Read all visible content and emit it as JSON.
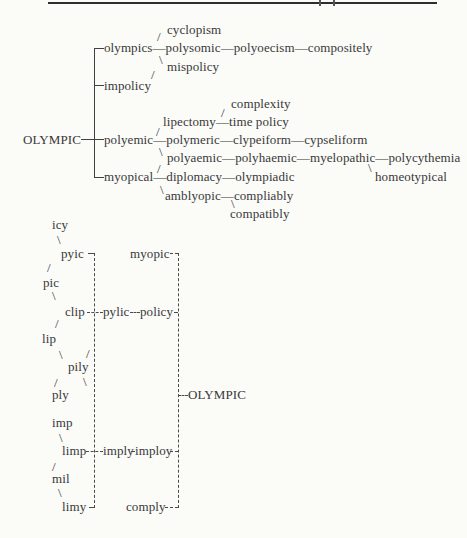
{
  "page": {
    "bg": "#fbfbf8",
    "ink": "#383838",
    "rule": {
      "x": 48,
      "y": 2,
      "w": 389,
      "h": 2
    },
    "ticks": [
      {
        "x": 319,
        "y": 0,
        "h": 6
      },
      {
        "x": 333,
        "y": 0,
        "h": 6
      }
    ]
  },
  "upper_tree": {
    "root_word": "OLYMPIC",
    "rows": [
      {
        "x": 167,
        "y": 23,
        "tokens": [
          "cyclopism"
        ]
      },
      {
        "x": 104,
        "y": 41,
        "tokens": [
          "olympics",
          "—",
          "polysomic",
          "—",
          "polyoecism",
          "—",
          "compositely"
        ]
      },
      {
        "x": 167,
        "y": 60,
        "tokens": [
          "mispolicy"
        ]
      },
      {
        "x": 104,
        "y": 79,
        "tokens": [
          "impolicy"
        ]
      },
      {
        "x": 231,
        "y": 97,
        "tokens": [
          "complexity"
        ]
      },
      {
        "x": 163,
        "y": 115,
        "tokens": [
          "lipectomy",
          "—",
          "time policy"
        ]
      },
      {
        "x": 23,
        "y": 133,
        "tokens": [
          "OLYMPIC"
        ]
      },
      {
        "x": 104,
        "y": 133,
        "tokens": [
          "polyemic",
          "—",
          "polymeric",
          "—",
          "clypeiform",
          "—",
          "cypseliform"
        ]
      },
      {
        "x": 167,
        "y": 151,
        "tokens": [
          "polyaemic",
          "—",
          "polyhaemic",
          "—",
          "myelopathic",
          "—",
          "polycythemia"
        ]
      },
      {
        "x": 104,
        "y": 170,
        "tokens": [
          "myopical",
          "—",
          "diplomacy",
          "—",
          "olympiadic"
        ]
      },
      {
        "x": 375,
        "y": 170,
        "tokens": [
          "homeotypical"
        ]
      },
      {
        "x": 165,
        "y": 189,
        "tokens": [
          "amblyopic",
          "—",
          "compliably"
        ]
      },
      {
        "x": 230,
        "y": 207,
        "tokens": [
          "compatibly"
        ]
      }
    ],
    "bracket": {
      "x": 94,
      "y1": 48,
      "y2": 177
    },
    "stubs": [
      {
        "x1": 94,
        "x2": 104,
        "y": 48
      },
      {
        "x1": 94,
        "x2": 104,
        "y": 85
      },
      {
        "x1": 81,
        "x2": 104,
        "y": 139
      },
      {
        "x1": 94,
        "x2": 104,
        "y": 177
      }
    ],
    "slashes": [
      {
        "g": "/",
        "x": 157,
        "y": 30
      },
      {
        "g": "\\",
        "x": 159,
        "y": 53
      },
      {
        "g": "/",
        "x": 151,
        "y": 68
      },
      {
        "g": "/",
        "x": 221,
        "y": 106
      },
      {
        "g": "/",
        "x": 156,
        "y": 125
      },
      {
        "g": "\\",
        "x": 159,
        "y": 145
      },
      {
        "g": "/",
        "x": 157,
        "y": 162
      },
      {
        "g": "\\",
        "x": 160,
        "y": 183
      },
      {
        "g": "\\",
        "x": 368,
        "y": 161
      },
      {
        "g": "\\",
        "x": 231,
        "y": 197
      }
    ]
  },
  "lower_chart": {
    "words": [
      {
        "t": "icy",
        "x": 52,
        "y": 218
      },
      {
        "t": "pyic",
        "x": 61,
        "y": 247
      },
      {
        "t": "myopic",
        "x": 130,
        "y": 247
      },
      {
        "t": "pic",
        "x": 43,
        "y": 276
      },
      {
        "t": "clip",
        "x": 65,
        "y": 305
      },
      {
        "t": "pylic",
        "x": 103,
        "y": 305
      },
      {
        "t": "policy",
        "x": 140,
        "y": 305
      },
      {
        "t": "lip",
        "x": 42,
        "y": 332
      },
      {
        "t": "pily",
        "x": 68,
        "y": 360
      },
      {
        "t": "ply",
        "x": 52,
        "y": 388
      },
      {
        "t": "OLYMPIC",
        "x": 188,
        "y": 388
      },
      {
        "t": "imp",
        "x": 52,
        "y": 416
      },
      {
        "t": "limp",
        "x": 62,
        "y": 444
      },
      {
        "t": "imply",
        "x": 103,
        "y": 444
      },
      {
        "t": "imploy",
        "x": 135,
        "y": 444
      },
      {
        "t": "mil",
        "x": 52,
        "y": 472
      },
      {
        "t": "limy",
        "x": 62,
        "y": 500
      },
      {
        "t": "comply",
        "x": 126,
        "y": 500
      }
    ],
    "slashes": [
      {
        "g": "\\",
        "x": 57,
        "y": 233
      },
      {
        "g": "/",
        "x": 47,
        "y": 261
      },
      {
        "g": "\\",
        "x": 52,
        "y": 289
      },
      {
        "g": "/",
        "x": 55,
        "y": 317
      },
      {
        "g": "\\",
        "x": 59,
        "y": 348
      },
      {
        "g": "/",
        "x": 86,
        "y": 347
      },
      {
        "g": "/",
        "x": 54,
        "y": 376
      },
      {
        "g": "\\",
        "x": 83,
        "y": 375
      },
      {
        "g": "\\",
        "x": 59,
        "y": 431
      },
      {
        "g": "/",
        "x": 52,
        "y": 460
      },
      {
        "g": "\\",
        "x": 58,
        "y": 486
      }
    ],
    "rails": [
      {
        "x": 94,
        "y1": 253,
        "y2": 508
      },
      {
        "x": 178,
        "y1": 253,
        "y2": 508
      }
    ],
    "dashes": [
      {
        "x1": 88,
        "x2": 94,
        "y": 253
      },
      {
        "x1": 170,
        "x2": 178,
        "y": 253
      },
      {
        "x1": 87,
        "x2": 103,
        "y": 312
      },
      {
        "x1": 130,
        "x2": 140,
        "y": 312
      },
      {
        "x1": 174,
        "x2": 178,
        "y": 312
      },
      {
        "x1": 178,
        "x2": 188,
        "y": 395
      },
      {
        "x1": 86,
        "x2": 103,
        "y": 451
      },
      {
        "x1": 131,
        "x2": 135,
        "y": 451
      },
      {
        "x1": 170,
        "x2": 178,
        "y": 451
      },
      {
        "x1": 89,
        "x2": 94,
        "y": 507
      },
      {
        "x1": 165,
        "x2": 178,
        "y": 507
      }
    ]
  }
}
